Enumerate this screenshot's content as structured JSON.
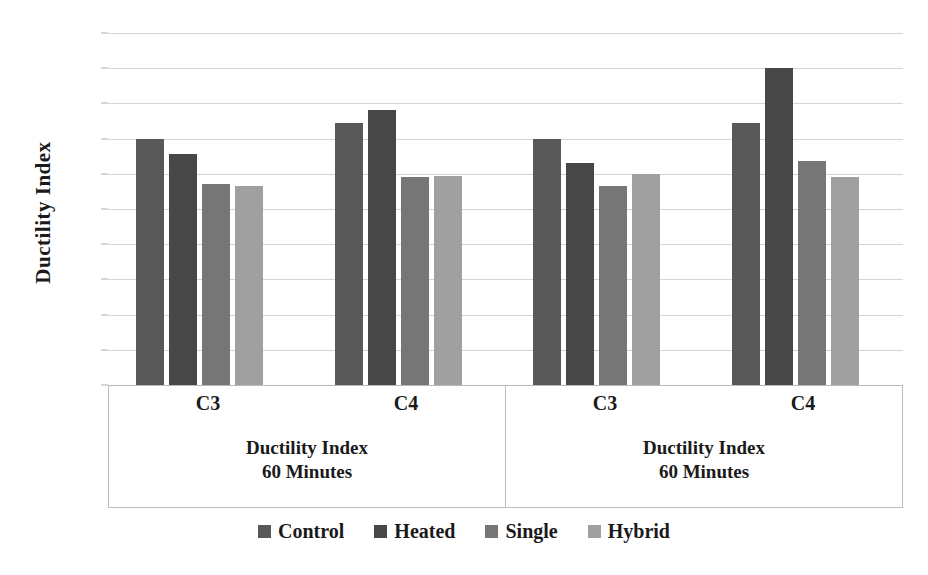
{
  "chart_data": {
    "type": "bar",
    "title": "",
    "xlabel": "",
    "ylabel": "Ductility Index",
    "ylim": [
      0,
      2
    ],
    "ytick_step": 0.2,
    "yticks": [
      "2",
      "1.8",
      "1.6",
      "1.4",
      "1.2",
      "1",
      "0.8",
      "0.6",
      "0.4",
      "0.2",
      "0"
    ],
    "grid": true,
    "legend_position": "bottom",
    "categories": [
      "C3",
      "C4",
      "C3",
      "C4"
    ],
    "panels": [
      {
        "label_line1": "Ductility Index",
        "label_line2": "60 Minutes",
        "categories": [
          "C3",
          "C4"
        ]
      },
      {
        "label_line1": "Ductility Index",
        "label_line2": "60 Minutes",
        "categories": [
          "C3",
          "C4"
        ]
      }
    ],
    "series": [
      {
        "name": "Control",
        "color": "#595959",
        "values": [
          1.4,
          1.49,
          1.4,
          1.49
        ]
      },
      {
        "name": "Heated",
        "color": "#474747",
        "values": [
          1.31,
          1.56,
          1.26,
          1.8
        ]
      },
      {
        "name": "Single",
        "color": "#767676",
        "values": [
          1.14,
          1.18,
          1.13,
          1.27
        ]
      },
      {
        "name": "Hybrid",
        "color": "#a0a0a0",
        "values": [
          1.13,
          1.19,
          1.2,
          1.18
        ]
      }
    ]
  },
  "legend": {
    "items": [
      {
        "label": "Control",
        "color": "#595959"
      },
      {
        "label": "Heated",
        "color": "#474747"
      },
      {
        "label": "Single",
        "color": "#767676"
      },
      {
        "label": "Hybrid",
        "color": "#a0a0a0"
      }
    ]
  }
}
